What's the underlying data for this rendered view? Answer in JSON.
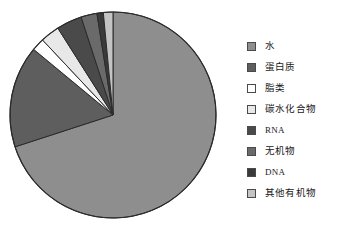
{
  "chart_data": {
    "type": "pie",
    "title": "",
    "subtitle": "",
    "xlabel": "",
    "ylabel": "",
    "legend_position": "right",
    "grid": false,
    "start_angle_deg": 0,
    "direction": "clockwise",
    "categories": [
      "水",
      "蛋白质",
      "脂类",
      "碳水化合物",
      "RNA",
      "无机物",
      "DNA",
      "其他有机物"
    ],
    "values": [
      70.0,
      16.0,
      2.0,
      3.0,
      4.0,
      2.5,
      1.0,
      1.5
    ],
    "unit": "%",
    "slices": [
      {
        "label": "水",
        "value": 70.0,
        "color": "#8e8e8e"
      },
      {
        "label": "蛋白质",
        "value": 16.0,
        "color": "#5e5e5e"
      },
      {
        "label": "脂类",
        "value": 2.0,
        "color": "#ffffff"
      },
      {
        "label": "碳水化合物",
        "value": 3.0,
        "color": "#e8e8e8"
      },
      {
        "label": "RNA",
        "value": 4.0,
        "color": "#4a4a4a"
      },
      {
        "label": "无机物",
        "value": 2.5,
        "color": "#6a6a6a"
      },
      {
        "label": "DNA",
        "value": 1.0,
        "color": "#3a3a3a"
      },
      {
        "label": "其他有机物",
        "value": 1.5,
        "color": "#c4c4c4"
      }
    ]
  },
  "legend": {
    "items": [
      {
        "label": "水",
        "color": "#8e8e8e"
      },
      {
        "label": "蛋白质",
        "color": "#5e5e5e"
      },
      {
        "label": "脂类",
        "color": "#ffffff"
      },
      {
        "label": "碳水化合物",
        "color": "#e8e8e8"
      },
      {
        "label": "RNA",
        "color": "#4a4a4a"
      },
      {
        "label": "无机物",
        "color": "#6a6a6a"
      },
      {
        "label": "DNA",
        "color": "#3a3a3a"
      },
      {
        "label": "其他有机物",
        "color": "#c4c4c4"
      }
    ]
  },
  "style": {
    "background": "#ffffff",
    "outline": "#2b2b2b",
    "text": "#1a1a1a"
  },
  "geometry": {
    "center_x": 113,
    "center_y": 115,
    "radius": 103
  }
}
